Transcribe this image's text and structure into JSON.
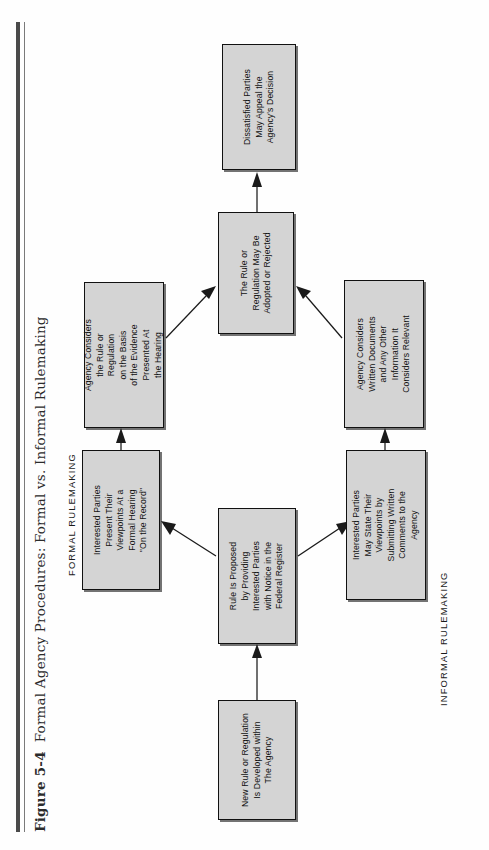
{
  "figure": {
    "number": "Figure 5-4",
    "title": "Formal Agency Procedures: Formal vs. Informal Rulemaking"
  },
  "sections": {
    "formal_label": "FORMAL RULEMAKING",
    "informal_label": "INFORMAL RULEMAKING"
  },
  "nodes": {
    "new_rule": "New Rule or Regulation\nIs Developed within\nThe Agency",
    "proposed": "Rule Is Proposed\nby Providing\nInterested Parties\nwith Notice in the\nFederal Register",
    "parties_formal": "Interested Parties\nPresent Their\nViewpoints At a\nFormal Hearing\n''On the Record''",
    "agency_hearing": "Agency Considers\nthe Rule or\nRegulation\non the Basis\nof the Evidence\nPresented At\nthe Hearing",
    "parties_informal": "Interested Parties\nMay State Their\nViewpoints by\nSubmitting Written\nComments to the\nAgency",
    "agency_written": "Agency Considers\nWritten Documents\nand Any Other\nInformation It\nConsiders Relevant",
    "adopted": "The Rule or\nRegulation May Be\nAdopted or Rejected",
    "appeal": "Dissatisfied Parties\nMay Appeal the\nAgency's Decision"
  },
  "chart_data": {
    "type": "flowchart",
    "title": "Formal Agency Procedures: Formal vs. Informal Rulemaking",
    "orientation": "bottom-to-top, rotated 90° counter-clockwise on page",
    "branches": [
      "FORMAL RULEMAKING",
      "INFORMAL RULEMAKING"
    ],
    "steps": [
      {
        "id": "new_rule",
        "label": "New Rule or Regulation Is Developed within The Agency",
        "branch": "common"
      },
      {
        "id": "proposed",
        "label": "Rule Is Proposed by Providing Interested Parties with Notice in the Federal Register",
        "branch": "common"
      },
      {
        "id": "parties_formal",
        "label": "Interested Parties Present Their Viewpoints At a Formal Hearing ''On the Record''",
        "branch": "formal"
      },
      {
        "id": "agency_hearing",
        "label": "Agency Considers the Rule or Regulation on the Basis of the Evidence Presented At the Hearing",
        "branch": "formal"
      },
      {
        "id": "parties_informal",
        "label": "Interested Parties May State Their Viewpoints by Submitting Written Comments to the Agency",
        "branch": "informal"
      },
      {
        "id": "agency_written",
        "label": "Agency Considers Written Documents and Any Other Information It Considers Relevant",
        "branch": "informal"
      },
      {
        "id": "adopted",
        "label": "The Rule or Regulation May Be Adopted or Rejected",
        "branch": "common"
      },
      {
        "id": "appeal",
        "label": "Dissatisfied Parties May Appeal the Agency's Decision",
        "branch": "common"
      }
    ],
    "edges": [
      {
        "from": "new_rule",
        "to": "proposed"
      },
      {
        "from": "proposed",
        "to": "parties_formal"
      },
      {
        "from": "proposed",
        "to": "parties_informal"
      },
      {
        "from": "parties_formal",
        "to": "agency_hearing"
      },
      {
        "from": "parties_informal",
        "to": "agency_written"
      },
      {
        "from": "agency_hearing",
        "to": "adopted"
      },
      {
        "from": "agency_written",
        "to": "adopted"
      },
      {
        "from": "adopted",
        "to": "appeal"
      }
    ]
  },
  "colors": {
    "box_fill": "#d4d4d4",
    "box_border": "#111111",
    "rule": "#4a4a4a",
    "text": "#111111",
    "page": "#ffffff"
  }
}
